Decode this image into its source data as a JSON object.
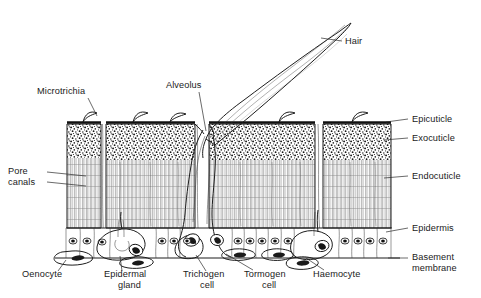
{
  "figure": {
    "background_color": "#ffffff",
    "ink_color": "#1a1a1a"
  },
  "labels": {
    "microtrichia": {
      "text": "Microtrichia",
      "x": 37,
      "y": 94,
      "anchor": "start"
    },
    "alveolus": {
      "text": "Alveolus",
      "x": 166,
      "y": 88,
      "anchor": "start"
    },
    "hair": {
      "text": "Hair",
      "x": 345,
      "y": 44,
      "anchor": "start"
    },
    "epicuticle": {
      "text": "Epicuticle",
      "x": 412,
      "y": 122,
      "anchor": "start"
    },
    "exocuticle": {
      "text": "Exocuticle",
      "x": 412,
      "y": 141,
      "anchor": "start"
    },
    "endocuticle": {
      "text": "Endocuticle",
      "x": 412,
      "y": 179,
      "anchor": "start"
    },
    "epidermis": {
      "text": "Epidermis",
      "x": 412,
      "y": 231,
      "anchor": "start"
    },
    "basement_membrane_line1": {
      "text": "Basement",
      "x": 412,
      "y": 260,
      "anchor": "start"
    },
    "basement_membrane_line2": {
      "text": "membrane",
      "x": 412,
      "y": 271,
      "anchor": "start"
    },
    "pore_canals_line1": {
      "text": "Pore",
      "x": 8,
      "y": 174,
      "anchor": "start"
    },
    "pore_canals_line2": {
      "text": "canals",
      "x": 8,
      "y": 185,
      "anchor": "start"
    },
    "oenocyte": {
      "text": "Oenocyte",
      "x": 22,
      "y": 277,
      "anchor": "start"
    },
    "epidermal_gland_line1": {
      "text": "Epidermal",
      "x": 104,
      "y": 277,
      "anchor": "start"
    },
    "epidermal_gland_line2": {
      "text": "gland",
      "x": 118,
      "y": 288,
      "anchor": "start"
    },
    "trichogen_cell_line1": {
      "text": "Trichogen",
      "x": 183,
      "y": 277,
      "anchor": "start"
    },
    "trichogen_cell_line2": {
      "text": "cell",
      "x": 200,
      "y": 288,
      "anchor": "start"
    },
    "tormogen_cell_line1": {
      "text": "Tormogen",
      "x": 244,
      "y": 277,
      "anchor": "start"
    },
    "tormogen_cell_line2": {
      "text": "cell",
      "x": 262,
      "y": 288,
      "anchor": "start"
    },
    "haemocyte": {
      "text": "Haemocyte",
      "x": 313,
      "y": 277,
      "anchor": "start"
    }
  },
  "structures": {
    "cuticle": {
      "left": 66,
      "right": 392,
      "top": 122,
      "bottom": 228
    },
    "exocuticle_band": {
      "top": 122,
      "bottom": 160
    },
    "endocuticle_band": {
      "top": 160,
      "bottom": 228
    },
    "epidermis_band": {
      "top": 228,
      "bottom": 258
    },
    "basement_membrane_y": 258
  }
}
